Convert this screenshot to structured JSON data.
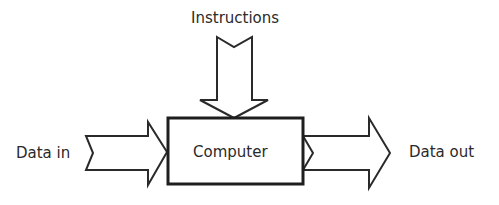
{
  "diagram": {
    "type": "block-flow",
    "title": "",
    "nodes": [
      {
        "id": "computer",
        "label": "Computer",
        "shape": "rectangle"
      }
    ],
    "inputs": [
      {
        "id": "instructions",
        "label": "Instructions",
        "direction": "down",
        "target": "computer"
      },
      {
        "id": "data_in",
        "label": "Data in",
        "direction": "right",
        "target": "computer"
      }
    ],
    "outputs": [
      {
        "id": "data_out",
        "label": "Data out",
        "direction": "right",
        "source": "computer"
      }
    ],
    "colors": {
      "stroke": "#2a2a2a",
      "fill": "#ffffff",
      "background": "#ffffff"
    }
  }
}
